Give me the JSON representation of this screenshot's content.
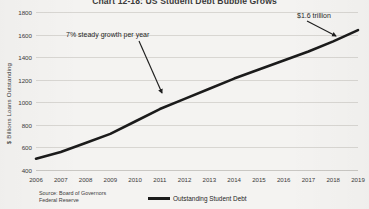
{
  "chart_data": {
    "type": "line",
    "title": "Chart 12-18: US Student Debt Bubble Grows",
    "xlabel": "",
    "ylabel": "$ Billions Loans Outstanding",
    "categories": [
      "2006",
      "2007",
      "2008",
      "2009",
      "2010",
      "2011",
      "2012",
      "2013",
      "2014",
      "2015",
      "2016",
      "2017",
      "2018",
      "2019"
    ],
    "series": [
      {
        "name": "Outstanding Student Debt",
        "values": [
          500,
          560,
          640,
          720,
          830,
          940,
          1030,
          1120,
          1210,
          1290,
          1370,
          1450,
          1540,
          1640
        ],
        "color": "#1b1b1b"
      }
    ],
    "ylim": [
      400,
      1800
    ],
    "yticks": [
      400,
      600,
      800,
      1000,
      1200,
      1400,
      1600,
      1800
    ],
    "grid": true,
    "legend_position": "bottom-center",
    "annotations": [
      {
        "text": "7% steady growth per year",
        "target_x": "2011",
        "target_y": 1000
      },
      {
        "text": "$1.6 trillion",
        "target_x": "2019",
        "target_y": 1640
      }
    ],
    "source": {
      "line1": "Source: Board of Governors",
      "line2": "Federal Reserve"
    },
    "background_color": "#f4f3f1",
    "gridline_color": "#d8d6d2"
  }
}
